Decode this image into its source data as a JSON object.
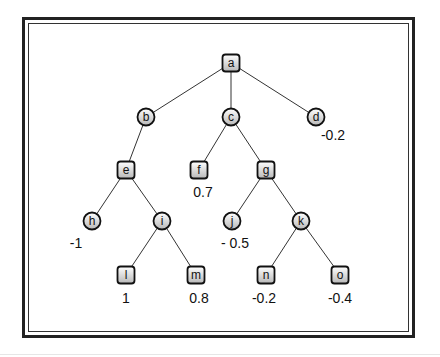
{
  "diagram": {
    "type": "game-tree",
    "colors": {
      "edge": "#333333",
      "node_fill_top": "#ffffff",
      "node_fill_bottom": "#bdbdbd",
      "node_stroke": "#111111",
      "frame": "#222222"
    },
    "nodes": [
      {
        "id": "a",
        "label": "a",
        "shape": "square",
        "x": 231,
        "y": 63,
        "value": ""
      },
      {
        "id": "b",
        "label": "b",
        "shape": "circle",
        "x": 146,
        "y": 117,
        "value": ""
      },
      {
        "id": "c",
        "label": "c",
        "shape": "circle",
        "x": 231,
        "y": 117,
        "value": ""
      },
      {
        "id": "d",
        "label": "d",
        "shape": "circle",
        "x": 316,
        "y": 117,
        "value": "-0.2",
        "vx": 333,
        "vy": 140
      },
      {
        "id": "e",
        "label": "e",
        "shape": "square",
        "x": 126,
        "y": 170,
        "value": ""
      },
      {
        "id": "f",
        "label": "f",
        "shape": "square",
        "x": 199,
        "y": 170,
        "value": "0.7",
        "vx": 203,
        "vy": 197
      },
      {
        "id": "g",
        "label": "g",
        "shape": "square",
        "x": 266,
        "y": 170,
        "value": ""
      },
      {
        "id": "h",
        "label": "h",
        "shape": "circle",
        "x": 92,
        "y": 221,
        "value": "-1",
        "vx": 76,
        "vy": 248
      },
      {
        "id": "i",
        "label": "i",
        "shape": "circle",
        "x": 162,
        "y": 221,
        "value": ""
      },
      {
        "id": "j",
        "label": "j",
        "shape": "circle",
        "x": 232,
        "y": 221,
        "value": "- 0.5",
        "vx": 235,
        "vy": 248
      },
      {
        "id": "k",
        "label": "k",
        "shape": "circle",
        "x": 301,
        "y": 221,
        "value": ""
      },
      {
        "id": "l",
        "label": "l",
        "shape": "square",
        "x": 126,
        "y": 275,
        "value": "1",
        "vx": 126,
        "vy": 303
      },
      {
        "id": "m",
        "label": "m",
        "shape": "square",
        "x": 196,
        "y": 275,
        "value": "0.8",
        "vx": 199,
        "vy": 303
      },
      {
        "id": "n",
        "label": "n",
        "shape": "square",
        "x": 266,
        "y": 275,
        "value": "-0.2",
        "vx": 264,
        "vy": 303
      },
      {
        "id": "o",
        "label": "o",
        "shape": "square",
        "x": 340,
        "y": 275,
        "value": "-0.4",
        "vx": 340,
        "vy": 303
      }
    ],
    "edges": [
      [
        "a",
        "b"
      ],
      [
        "a",
        "c"
      ],
      [
        "a",
        "d"
      ],
      [
        "b",
        "e"
      ],
      [
        "c",
        "f"
      ],
      [
        "c",
        "g"
      ],
      [
        "e",
        "h"
      ],
      [
        "e",
        "i"
      ],
      [
        "g",
        "j"
      ],
      [
        "g",
        "k"
      ],
      [
        "i",
        "l"
      ],
      [
        "i",
        "m"
      ],
      [
        "k",
        "n"
      ],
      [
        "k",
        "o"
      ]
    ]
  }
}
